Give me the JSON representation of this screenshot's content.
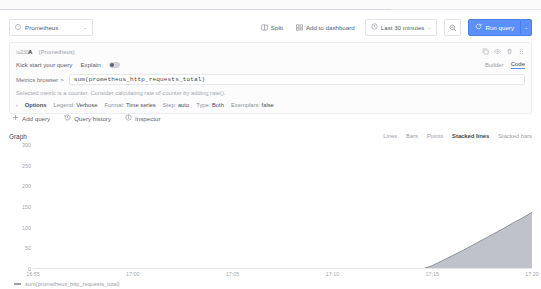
{
  "header": {
    "datasource": {
      "name": "Prometheus",
      "icon": "prometheus-icon",
      "caret": "⌄"
    },
    "split_label": "Split",
    "add_to_dashboard_label": "Add to dashboard",
    "time_range_label": "Last 30 minutes",
    "time_caret": "⌄",
    "run_query_label": "Run query",
    "run_caret": "⌄"
  },
  "query": {
    "ref_id": "A",
    "datasource_label": "(Prometheus)",
    "kick_start_label": "Kick start your query",
    "explain_label": "Explain",
    "mode_builder": "Builder",
    "mode_code": "Code",
    "metrics_browser_label": "Metrics browser",
    "metrics_browser_caret": ">",
    "expression": "sum(prometheus_http_requests_total)",
    "hint": "Selected metric is a counter. Consider calculating rate of counter by adding rate().",
    "options_label": "Options",
    "options_caret": "›",
    "options": [
      {
        "key": "Legend:",
        "value": "Verbose"
      },
      {
        "key": "Format:",
        "value": "Time series"
      },
      {
        "key": "Step:",
        "value": "auto"
      },
      {
        "key": "Type:",
        "value": "Both"
      },
      {
        "key": "Exemplars:",
        "value": "false"
      }
    ]
  },
  "actions": {
    "add_query_label": "Add query",
    "query_history_label": "Query history",
    "inspector_label": "Inspector"
  },
  "graph": {
    "title": "Graph",
    "display_modes": [
      "Lines",
      "Bars",
      "Points",
      "Stacked lines",
      "Stacked bars"
    ],
    "active_display_mode": "Stacked lines",
    "legend_series": "sum(prometheus_http_requests_total)"
  },
  "chart_data": {
    "type": "area",
    "title": "Graph",
    "xlabel": "",
    "ylabel": "",
    "ylim": [
      0,
      300
    ],
    "yticks": [
      300,
      250,
      200,
      150,
      100,
      50,
      0
    ],
    "xticks": [
      "16:55",
      "17:00",
      "17:05",
      "17:10",
      "17:15",
      "17:20"
    ],
    "xtick_positions": [
      0.0,
      0.2,
      0.4,
      0.6,
      0.8,
      1.0
    ],
    "grid": false,
    "legend_position": "bottom-left",
    "series": [
      {
        "name": "sum(prometheus_http_requests_total)",
        "color": "#9aa0a9",
        "x": [
          0.0,
          0.02,
          0.04,
          0.06,
          0.08,
          0.1,
          0.12,
          0.14,
          0.16,
          0.18,
          0.2,
          0.22,
          0.24,
          0.26,
          0.28,
          0.3,
          0.32,
          0.34,
          0.36,
          0.38,
          0.4,
          0.42,
          0.44,
          0.46,
          0.48,
          0.5,
          0.52,
          0.54,
          0.56,
          0.58,
          0.6,
          0.62,
          0.64,
          0.66,
          0.68,
          0.7,
          0.72,
          0.74,
          0.76,
          0.78,
          0.8,
          0.82,
          0.84,
          0.86,
          0.88,
          0.9,
          0.92,
          0.94,
          0.96,
          0.98,
          1.0
        ],
        "values": [
          0,
          0,
          0,
          0,
          0,
          0,
          0,
          0,
          0,
          0,
          0,
          0,
          0,
          0,
          0,
          0,
          0,
          0,
          0,
          0,
          0,
          0,
          0,
          0,
          0,
          0,
          0,
          0,
          0,
          0,
          0,
          0,
          0,
          0,
          0,
          0,
          0,
          0,
          0,
          0,
          8,
          20,
          32,
          44,
          57,
          70,
          83,
          96,
          110,
          123,
          137
        ]
      }
    ]
  }
}
